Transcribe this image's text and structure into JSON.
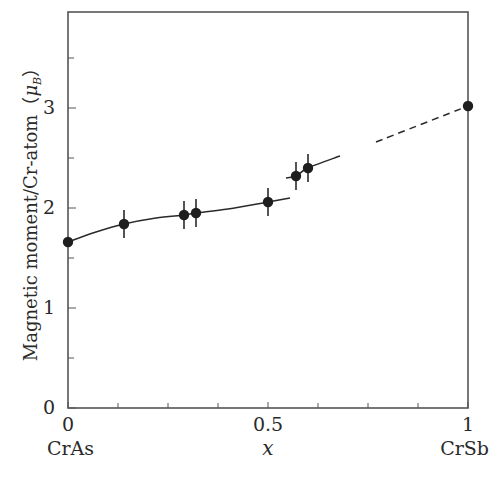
{
  "chart_data": {
    "type": "scatter",
    "title": "",
    "xlabel": "x",
    "ylabel": "Magnetic moment/Cr-atom（μ_B）",
    "ylabel_main": "Magnetic moment/Cr-atom（",
    "ylabel_mu": "μ",
    "ylabel_sub": "B",
    "ylabel_close": "）",
    "xlim": [
      0,
      1
    ],
    "ylim": [
      0,
      3.96
    ],
    "x_ticks": [
      0,
      0.5,
      1
    ],
    "x_tick_labels": [
      "0",
      "0.5",
      "1"
    ],
    "x_minor_ticks": [
      0.125,
      0.25,
      0.375,
      0.625,
      0.75,
      0.875
    ],
    "y_ticks": [
      0,
      1,
      2,
      3
    ],
    "y_tick_labels": [
      "0",
      "1",
      "2",
      "3"
    ],
    "y_minor_ticks": [
      0.5,
      1.5,
      2.5,
      3.5
    ],
    "x_end_labels": {
      "left": "CrAs",
      "right": "CrSb"
    },
    "grid": false,
    "legend": null,
    "series": [
      {
        "name": "measured",
        "marker": "filled-circle",
        "x": [
          0,
          0.14,
          0.29,
          0.32,
          0.5,
          0.57,
          0.6,
          1.0
        ],
        "y": [
          1.66,
          1.84,
          1.93,
          1.95,
          2.06,
          2.32,
          2.4,
          3.02
        ],
        "yerr": [
          0,
          0.14,
          0.14,
          0.14,
          0.14,
          0.14,
          0.14,
          0
        ]
      }
    ],
    "fit_curves": [
      {
        "style": "solid",
        "x": [
          0,
          0.07,
          0.14,
          0.22,
          0.29,
          0.32,
          0.4,
          0.5,
          0.555
        ],
        "y": [
          1.66,
          1.76,
          1.84,
          1.9,
          1.93,
          1.95,
          1.99,
          2.06,
          2.1
        ]
      },
      {
        "style": "solid",
        "x": [
          0.545,
          0.57,
          0.6,
          0.68
        ],
        "y": [
          2.3,
          2.32,
          2.4,
          2.52
        ]
      },
      {
        "style": "dashed",
        "x": [
          0.77,
          1.0
        ],
        "y": [
          2.66,
          3.02
        ]
      }
    ]
  },
  "colors": {
    "ink": "#2a2a2a",
    "axis": "#555555",
    "background": "#ffffff"
  },
  "layout": {
    "plot_left": 68,
    "plot_right": 468,
    "plot_top": 12,
    "plot_bottom": 408
  }
}
